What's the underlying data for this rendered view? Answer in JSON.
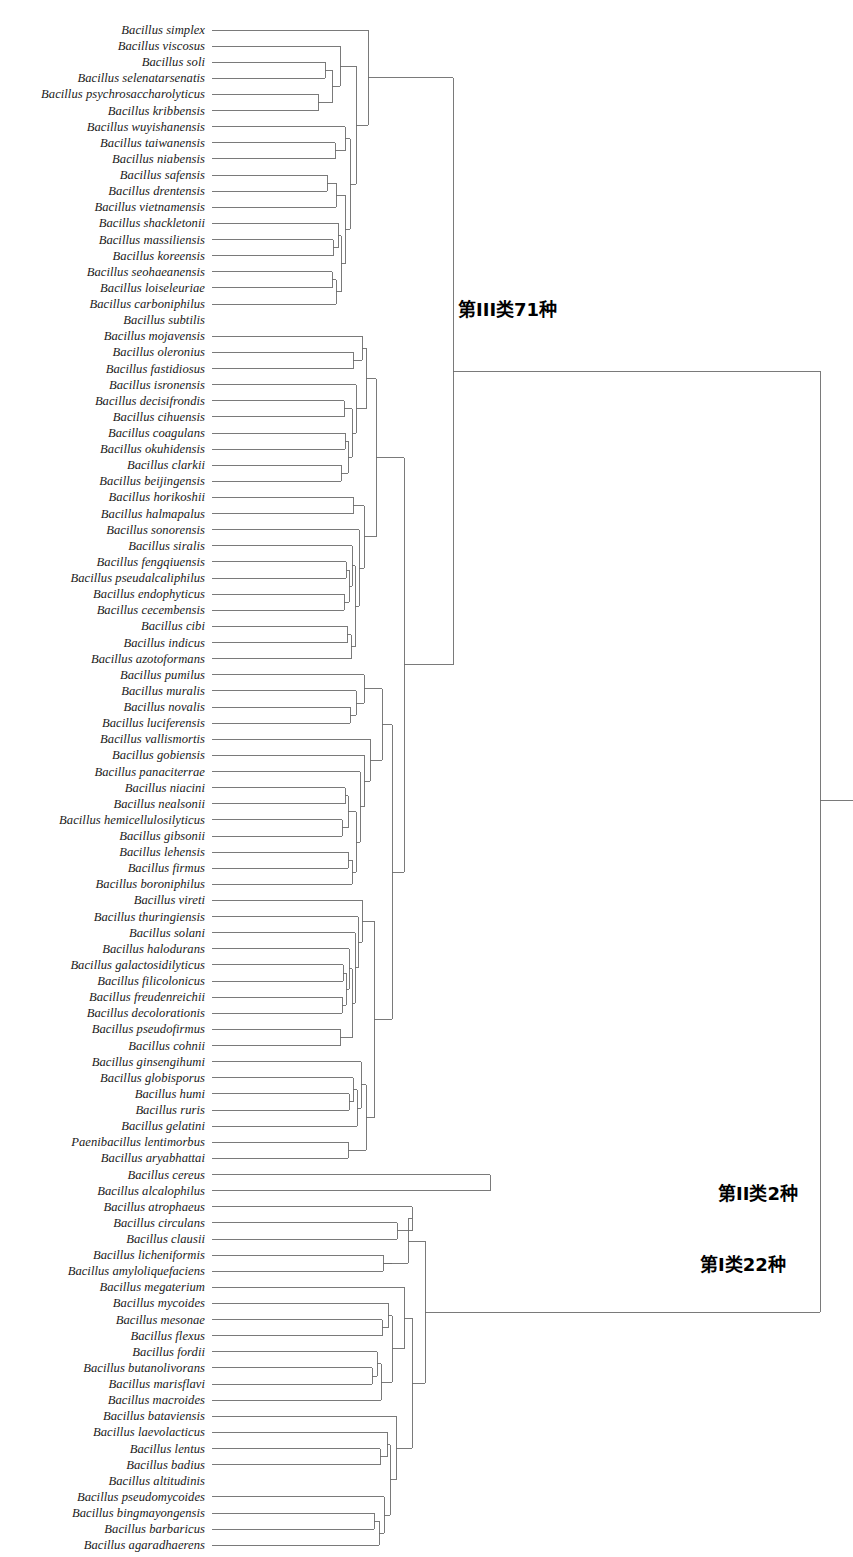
{
  "figure": {
    "type": "dendrogram",
    "orientation": "horizontal-right",
    "line_color": "#6b6b6b",
    "text_color": "#1a1a1a",
    "width": 853,
    "height": 1557
  },
  "group_labels": [
    {
      "text": "第III类71种",
      "x": 458,
      "y": 308
    },
    {
      "text": "第II类2种",
      "x": 718,
      "y": 1192
    },
    {
      "text": "第I类22种",
      "x": 700,
      "y": 1263
    }
  ],
  "chart_data": {
    "type": "dendrogram",
    "title": "",
    "xlabel": "",
    "ylabel": "",
    "leaf_count": 95,
    "clusters": [
      {
        "name": "第III类71种",
        "members": 71
      },
      {
        "name": "第II类2种",
        "members": 2
      },
      {
        "name": "第I类22种",
        "members": 22
      }
    ],
    "leaves": [
      "Bacillus simplex",
      "Bacillus viscosus",
      "Bacillus soli",
      "Bacillus selenatarsenatis",
      "Bacillus psychrosaccharolyticus",
      "Bacillus kribbensis",
      "Bacillus wuyishanensis",
      "Bacillus taiwanensis",
      "Bacillus niabensis",
      "Bacillus safensis",
      "Bacillus drentensis",
      "Bacillus vietnamensis",
      "Bacillus shackletonii",
      "Bacillus massiliensis",
      "Bacillus koreensis",
      "Bacillus seohaeanensis",
      "Bacillus loiseleuriae",
      "Bacillus carboniphilus",
      "Bacillus subtilis",
      "Bacillus mojavensis",
      "Bacillus oleronius",
      "Bacillus fastidiosus",
      "Bacillus isronensis",
      "Bacillus decisifrondis",
      "Bacillus cihuensis",
      "Bacillus coagulans",
      "Bacillus okuhidensis",
      "Bacillus clarkii",
      "Bacillus beijingensis",
      "Bacillus horikoshii",
      "Bacillus halmapalus",
      "Bacillus sonorensis",
      "Bacillus siralis",
      "Bacillus fengqiuensis",
      "Bacillus pseudalcaliphilus",
      "Bacillus endophyticus",
      "Bacillus cecembensis",
      "Bacillus cibi",
      "Bacillus indicus",
      "Bacillus azotoformans",
      "Bacillus pumilus",
      "Bacillus muralis",
      "Bacillus novalis",
      "Bacillus luciferensis",
      "Bacillus vallismortis",
      "Bacillus gobiensis",
      "Bacillus panaciterrae",
      "Bacillus niacini",
      "Bacillus nealsonii",
      "Bacillus hemicellulosilyticus",
      "Bacillus gibsonii",
      "Bacillus lehensis",
      "Bacillus firmus",
      "Bacillus boroniphilus",
      "Bacillus vireti",
      "Bacillus thuringiensis",
      "Bacillus solani",
      "Bacillus halodurans",
      "Bacillus galactosidilyticus",
      "Bacillus filicolonicus",
      "Bacillus freudenreichii",
      "Bacillus decolorationis",
      "Bacillus pseudofirmus",
      "Bacillus cohnii",
      "Bacillus ginsengihumi",
      "Bacillus globisporus",
      "Bacillus humi",
      "Bacillus ruris",
      "Bacillus gelatini",
      "Paenibacillus lentimorbus",
      "Bacillus aryabhattai",
      "Bacillus cereus",
      "Bacillus alcalophilus",
      "Bacillus atrophaeus",
      "Bacillus circulans",
      "Bacillus clausii",
      "Bacillus licheniformis",
      "Bacillus amyloliquefaciens",
      "Bacillus megaterium",
      "Bacillus mycoides",
      "Bacillus mesonae",
      "Bacillus flexus",
      "Bacillus fordii",
      "Bacillus butanolivorans",
      "Bacillus marisflavi",
      "Bacillus macroides",
      "Bacillus bataviensis",
      "Bacillus laevolacticus",
      "Bacillus lentus",
      "Bacillus badius",
      "Bacillus altitudinis",
      "Bacillus pseudomycoides",
      "Bacillus bingmayongensis",
      "Bacillus barbaricus",
      "Bacillus agaradhaerens"
    ],
    "leaf_y_start": 30,
    "leaf_y_step": 16.12,
    "leaf_tip_x": 212,
    "root_x": 820,
    "links": [
      [
        212,
        30,
        368,
        30
      ],
      [
        212,
        46,
        340,
        46
      ],
      [
        212,
        62,
        330,
        62
      ],
      [
        212,
        78,
        325,
        78
      ],
      [
        212,
        95,
        318,
        95
      ],
      [
        212,
        111,
        318,
        111
      ],
      [
        212,
        127,
        345,
        127
      ],
      [
        212,
        143,
        338,
        143
      ],
      [
        212,
        159,
        335,
        159
      ],
      [
        212,
        175,
        332,
        175
      ],
      [
        212,
        191,
        327,
        191
      ],
      [
        212,
        208,
        336,
        208
      ],
      [
        212,
        224,
        338,
        224
      ],
      [
        212,
        240,
        333,
        240
      ],
      [
        212,
        256,
        333,
        256
      ],
      [
        212,
        272,
        334,
        272
      ],
      [
        212,
        288,
        332,
        288
      ],
      [
        212,
        304,
        331,
        304
      ],
      [
        212,
        320,
        366,
        320
      ],
      [
        212,
        336,
        362,
        336
      ],
      [
        212,
        352,
        356,
        352
      ],
      [
        212,
        369,
        353,
        369
      ],
      [
        212,
        385,
        352,
        385
      ],
      [
        212,
        401,
        344,
        401
      ],
      [
        212,
        417,
        342,
        417
      ],
      [
        212,
        433,
        345,
        433
      ],
      [
        212,
        449,
        342,
        449
      ],
      [
        212,
        465,
        341,
        465
      ],
      [
        212,
        482,
        340,
        482
      ],
      [
        212,
        498,
        353,
        498
      ],
      [
        212,
        514,
        353,
        514
      ],
      [
        212,
        530,
        351,
        530
      ],
      [
        212,
        546,
        346,
        546
      ],
      [
        212,
        562,
        348,
        562
      ],
      [
        212,
        578,
        346,
        578
      ],
      [
        212,
        595,
        344,
        595
      ],
      [
        212,
        611,
        343,
        611
      ],
      [
        212,
        627,
        348,
        627
      ],
      [
        212,
        643,
        347,
        643
      ],
      [
        212,
        659,
        347,
        659
      ],
      [
        212,
        675,
        361,
        675
      ],
      [
        212,
        691,
        352,
        691
      ],
      [
        212,
        708,
        350,
        708
      ],
      [
        212,
        724,
        350,
        724
      ],
      [
        212,
        740,
        356,
        740
      ],
      [
        212,
        756,
        352,
        756
      ],
      [
        212,
        772,
        351,
        772
      ],
      [
        212,
        788,
        345,
        788
      ],
      [
        212,
        805,
        343,
        805
      ],
      [
        212,
        821,
        342,
        821
      ],
      [
        212,
        837,
        341,
        837
      ],
      [
        212,
        853,
        348,
        853
      ],
      [
        212,
        869,
        347,
        869
      ],
      [
        212,
        885,
        349,
        885
      ],
      [
        212,
        901,
        354,
        901
      ],
      [
        212,
        918,
        350,
        918
      ],
      [
        212,
        934,
        347,
        934
      ],
      [
        212,
        950,
        344,
        950
      ],
      [
        212,
        966,
        343,
        966
      ],
      [
        212,
        982,
        342,
        982
      ],
      [
        212,
        998,
        342,
        998
      ],
      [
        212,
        1014,
        341,
        1014
      ],
      [
        212,
        1031,
        340,
        1031
      ],
      [
        212,
        1047,
        338,
        1047
      ],
      [
        212,
        1063,
        350,
        1063
      ],
      [
        212,
        1079,
        349,
        1079
      ],
      [
        212,
        1095,
        349,
        1095
      ],
      [
        212,
        1111,
        348,
        1111
      ],
      [
        212,
        1127,
        340,
        1127
      ],
      [
        212,
        1144,
        348,
        1144
      ],
      [
        212,
        1160,
        346,
        1160
      ],
      [
        212,
        1176,
        490,
        1176
      ],
      [
        212,
        1192,
        820,
        1192
      ],
      [
        212,
        1208,
        412,
        1208
      ],
      [
        212,
        1224,
        400,
        1224
      ],
      [
        212,
        1240,
        397,
        1240
      ],
      [
        212,
        1257,
        390,
        1257
      ],
      [
        212,
        1273,
        383,
        1273
      ],
      [
        212,
        1289,
        404,
        1289
      ],
      [
        212,
        1305,
        388,
        1305
      ],
      [
        212,
        1321,
        382,
        1321
      ],
      [
        212,
        1337,
        377,
        1337
      ],
      [
        212,
        1353,
        372,
        1353
      ],
      [
        212,
        1370,
        375,
        1370
      ],
      [
        212,
        1386,
        372,
        1386
      ],
      [
        212,
        1402,
        370,
        1402
      ],
      [
        212,
        1418,
        366,
        1418
      ],
      [
        212,
        1434,
        396,
        1434
      ],
      [
        212,
        1450,
        387,
        1450
      ],
      [
        212,
        1466,
        380,
        1466
      ],
      [
        212,
        1483,
        376,
        1483
      ],
      [
        212,
        1499,
        384,
        1499
      ],
      [
        212,
        1515,
        379,
        1515
      ],
      [
        212,
        1531,
        374,
        1531
      ],
      [
        212,
        1547,
        369,
        1547
      ]
    ]
  }
}
